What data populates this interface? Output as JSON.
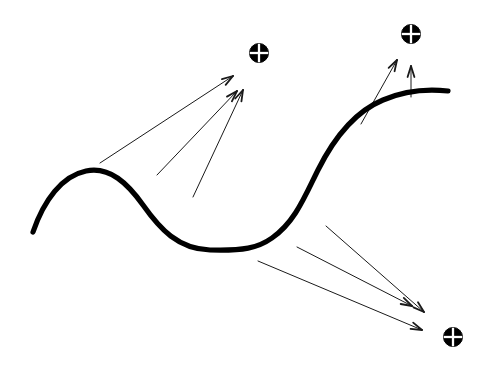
{
  "figure": {
    "title": "",
    "background_color": "#ffffff",
    "width": 491,
    "height": 380
  },
  "chart_data": {
    "type": "diagram",
    "title": "",
    "xlabel": "",
    "ylabel": "",
    "xlim": [
      0,
      491
    ],
    "ylim": [
      0,
      380
    ],
    "grid": false,
    "legend": "none",
    "curve": {
      "name": "main-curve",
      "label": "wavy curve",
      "color": "#000000",
      "stroke_width": 5.2,
      "path": "M 33 232 C 44 200 62 176 86 171 C 110 166 128 184 143 205 C 160 229 178 249 210 250 C 243 251 258 248 272 238 C 295 222 305 196 318 170 C 334 138 354 112 383 100 C 406 90 430 89 448 91",
      "points": [
        {
          "x": 33,
          "y": 232
        },
        {
          "x": 105,
          "y": 172
        },
        {
          "x": 160,
          "y": 213
        },
        {
          "x": 250,
          "y": 249
        },
        {
          "x": 318,
          "y": 170
        },
        {
          "x": 390,
          "y": 98
        },
        {
          "x": 448,
          "y": 91
        }
      ]
    },
    "targets": [
      {
        "name": "target-upper-left",
        "symbol": "circled-cross",
        "x": 259,
        "y": 53,
        "radius": 9.5,
        "color": "#000000"
      },
      {
        "name": "target-upper-right",
        "symbol": "circled-cross",
        "x": 411,
        "y": 34,
        "radius": 9.5,
        "color": "#000000"
      },
      {
        "name": "target-lower-right",
        "symbol": "circled-cross",
        "x": 453,
        "y": 337,
        "radius": 9.5,
        "color": "#000000"
      }
    ],
    "arrow_groups": [
      {
        "name": "arrow-group-upper-left",
        "target": "target-upper-left",
        "count": 3,
        "color": "#1a1a1a",
        "stroke_width": 1.0,
        "arrows": [
          {
            "x1": 100,
            "y1": 163,
            "x2": 233,
            "y2": 76
          },
          {
            "x1": 157,
            "y1": 175,
            "x2": 237,
            "y2": 91
          },
          {
            "x1": 193,
            "y1": 197,
            "x2": 243,
            "y2": 90
          }
        ]
      },
      {
        "name": "arrow-group-upper-right",
        "target": "target-upper-right",
        "count": 2,
        "color": "#1a1a1a",
        "stroke_width": 1.0,
        "arrows": [
          {
            "x1": 361,
            "y1": 124,
            "x2": 397,
            "y2": 60
          },
          {
            "x1": 411,
            "y1": 97,
            "x2": 411,
            "y2": 66
          }
        ]
      },
      {
        "name": "arrow-group-lower-right",
        "target": "target-lower-right",
        "count": 3,
        "color": "#1a1a1a",
        "stroke_width": 1.0,
        "arrows": [
          {
            "x1": 326,
            "y1": 226,
            "x2": 424,
            "y2": 312
          },
          {
            "x1": 297,
            "y1": 247,
            "x2": 412,
            "y2": 306
          },
          {
            "x1": 258,
            "y1": 261,
            "x2": 422,
            "y2": 330
          }
        ]
      }
    ]
  }
}
